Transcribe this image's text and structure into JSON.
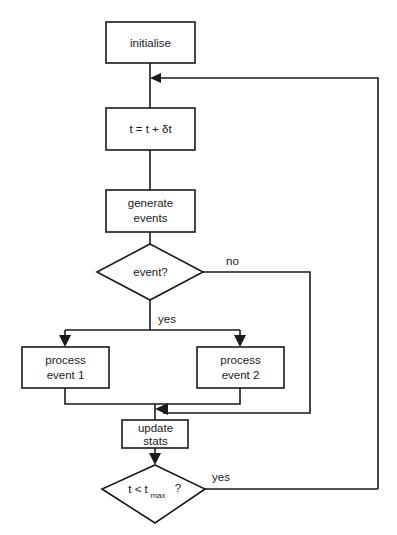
{
  "diagram": {
    "background_color": "#ffffff",
    "line_color": "#1a1a1a",
    "text_color": "#1a1a1a",
    "nodes": [
      {
        "id": "initialise",
        "type": "process",
        "label": "initialise",
        "label2": ""
      },
      {
        "id": "advance_time",
        "type": "process",
        "label": "t = t + δt",
        "label2": ""
      },
      {
        "id": "generate",
        "type": "process",
        "label": "generate",
        "label2": "events"
      },
      {
        "id": "event_test",
        "type": "decision",
        "label": "event?",
        "label2": ""
      },
      {
        "id": "process_ev1",
        "type": "process",
        "label": "process",
        "label2": "event 1"
      },
      {
        "id": "process_ev2",
        "type": "process",
        "label": "process",
        "label2": "event 2"
      },
      {
        "id": "update_stats",
        "type": "process",
        "label": "update",
        "label2": "stats"
      },
      {
        "id": "time_test",
        "type": "decision",
        "label_pre": "t < t",
        "label_sub": "max",
        "label_post": "?"
      }
    ],
    "edge_labels": {
      "event_no": "no",
      "event_yes": "yes",
      "time_yes": "yes"
    }
  }
}
